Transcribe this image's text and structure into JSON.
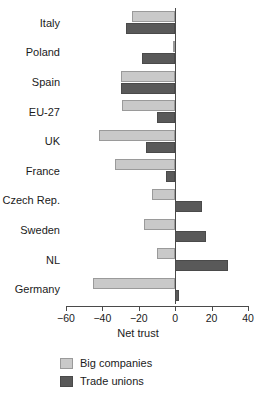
{
  "chart_data": {
    "type": "bar",
    "orientation": "horizontal",
    "title": "",
    "xlabel": "Net trust",
    "ylabel": "",
    "xlim": [
      -60,
      40
    ],
    "xticks": [
      -60,
      -40,
      -20,
      0,
      20,
      40
    ],
    "xtick_labels": [
      "−60",
      "−40",
      "−20",
      "0",
      "20",
      "40"
    ],
    "grid": false,
    "legend_position": "bottom-left",
    "categories": [
      "Italy",
      "Poland",
      "Spain",
      "EU-27",
      "UK",
      "France",
      "Czech Rep.",
      "Sweden",
      "NL",
      "Germany"
    ],
    "series": [
      {
        "name": "Big companies",
        "color": "#c9c9c9",
        "values": [
          -24,
          -1,
          -30,
          -29,
          -42,
          -33,
          -13,
          -17,
          -10,
          -45
        ]
      },
      {
        "name": "Trade unions",
        "color": "#595959",
        "values": [
          -27,
          -18,
          -30,
          -10,
          -16,
          -5,
          15,
          17,
          29,
          2
        ]
      }
    ]
  },
  "legend": {
    "items": [
      {
        "label": "Big companies",
        "swatch": "light"
      },
      {
        "label": "Trade unions",
        "swatch": "dark"
      }
    ]
  }
}
